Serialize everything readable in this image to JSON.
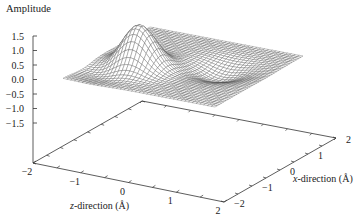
{
  "chart_data": {
    "type": "surface3d",
    "title": "",
    "zlabel": "Amplitude",
    "xlabel": "x-direction (Å)",
    "ylabel": "z-direction (Å)",
    "xlabel_italic": "x",
    "xlabel_rest": "-direction (Å)",
    "ylabel_italic": "z",
    "ylabel_rest": "-direction (Å)",
    "amplitude_ticks": [
      "1.5",
      "1.0",
      "0.5",
      "0.0",
      "−0.5",
      "−1.0",
      "−1.5"
    ],
    "amplitude_values": [
      1.5,
      1.0,
      0.5,
      0.0,
      -0.5,
      -1.0,
      -1.5
    ],
    "z_ticks": [
      "−2",
      "−1",
      "0",
      "1",
      "2"
    ],
    "x_ticks": [
      "−2",
      "−1",
      "0",
      "1",
      "2"
    ],
    "x_range": [
      -2,
      2
    ],
    "z_range": [
      -2,
      2
    ],
    "amplitude_range": [
      -1.5,
      1.5
    ],
    "features": [
      {
        "type": "peak",
        "x": -0.5,
        "z": -0.9,
        "amplitude": 1.5
      },
      {
        "type": "trough",
        "x": 0.3,
        "z": 0.8,
        "amplitude": -0.4
      },
      {
        "type": "dip",
        "x": -1.0,
        "z": -1.3,
        "amplitude": -0.3
      }
    ],
    "grid": false,
    "style": "wireframe mesh, gray"
  },
  "colors": {
    "mesh": "#555555",
    "axis": "#333333",
    "background": "#ffffff"
  }
}
